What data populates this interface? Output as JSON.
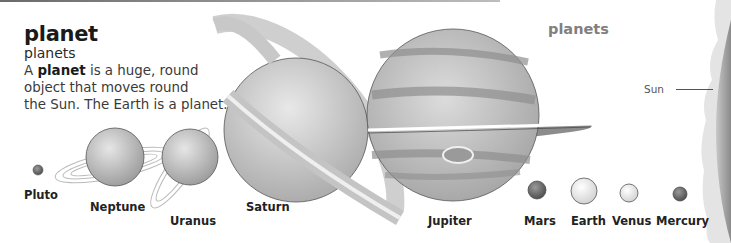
{
  "entry": {
    "headword": "planet",
    "plural": "planets",
    "definition_prefix": "A ",
    "definition_term": "planet",
    "definition_line1_rest": " is a huge, round",
    "definition_line2": "object that moves round",
    "definition_line3": "the Sun. The Earth is a planet."
  },
  "section_heading": "planets",
  "sun": {
    "label": "Sun"
  },
  "planets": [
    {
      "name": "Pluto"
    },
    {
      "name": "Neptune"
    },
    {
      "name": "Uranus"
    },
    {
      "name": "Saturn"
    },
    {
      "name": "Jupiter"
    },
    {
      "name": "Mars"
    },
    {
      "name": "Earth"
    },
    {
      "name": "Venus"
    },
    {
      "name": "Mercury"
    }
  ]
}
